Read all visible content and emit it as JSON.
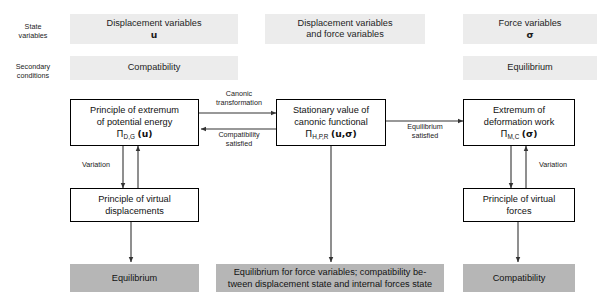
{
  "figure": {
    "row_labels": [
      {
        "id": "state-variables",
        "line1": "State",
        "line2": "variables"
      },
      {
        "id": "secondary-conditions",
        "line1": "Secondary",
        "line2": "conditions"
      }
    ],
    "banners": [
      {
        "id": "banner-displacement-variables",
        "line1": "Displacement variables",
        "line2": "u",
        "line2_symbol": true
      },
      {
        "id": "banner-displacement-and-force-variables",
        "line1": "Displacement variables",
        "line2": "and force variables",
        "line2_symbol": false
      },
      {
        "id": "banner-force-variables",
        "line1": "Force variables",
        "line2": "σ",
        "line2_symbol": true
      },
      {
        "id": "banner-compatibility",
        "line1": "Compatibility",
        "line2": "",
        "line2_symbol": false
      },
      {
        "id": "banner-equilibrium",
        "line1": "Equilibrium",
        "line2": "",
        "line2_symbol": false
      }
    ],
    "nodes": [
      {
        "id": "node-potential-energy",
        "line1": "Principle of extremum",
        "line2": "of potential energy",
        "formula_pi": "Π",
        "formula_sub": "D,G",
        "formula_args": "(u)"
      },
      {
        "id": "node-canonic-functional",
        "line1": "Stationary value of",
        "line2": "canonic functional",
        "formula_pi": "Π",
        "formula_sub": "H,P,R",
        "formula_args": "(u,σ)"
      },
      {
        "id": "node-deformation-work",
        "line1": "Extremum of",
        "line2": "deformation work",
        "formula_pi": "Π",
        "formula_sub": "M,C",
        "formula_args": "(σ)"
      },
      {
        "id": "node-virtual-displacements",
        "line1": "Principle of virtual",
        "line2": "displacements",
        "formula_pi": "",
        "formula_sub": "",
        "formula_args": ""
      },
      {
        "id": "node-virtual-forces",
        "line1": "Principle of virtual",
        "line2": "forces",
        "formula_pi": "",
        "formula_sub": "",
        "formula_args": ""
      }
    ],
    "edge_captions": [
      {
        "id": "caption-canonic-transformation",
        "line1": "Canonic",
        "line2": "transformation"
      },
      {
        "id": "caption-compatibility-satisfied",
        "line1": "Compatibility",
        "line2": "satisfied"
      },
      {
        "id": "caption-equilibrium-satisfied",
        "line1": "Equilibrium",
        "line2": "satisfied"
      },
      {
        "id": "caption-variation-left",
        "line1": "Variation",
        "line2": ""
      },
      {
        "id": "caption-variation-right",
        "line1": "Variation",
        "line2": ""
      }
    ],
    "results": [
      {
        "id": "result-equilibrium",
        "line1": "Equilibrium",
        "line2": ""
      },
      {
        "id": "result-mixed",
        "line1": "Equilibrium for force variables; compatibility be-",
        "line2": "tween displacement state and internal forces state"
      },
      {
        "id": "result-compatibility",
        "line1": "Compatibility",
        "line2": ""
      }
    ],
    "colors": {
      "banner_fill": "#ececec",
      "result_fill": "#b6b6b6",
      "node_border": "#000000",
      "node_fill": "#ffffff",
      "arrow": "#333333",
      "text": "#1a1a1a",
      "page_background": "#ffffff"
    }
  }
}
